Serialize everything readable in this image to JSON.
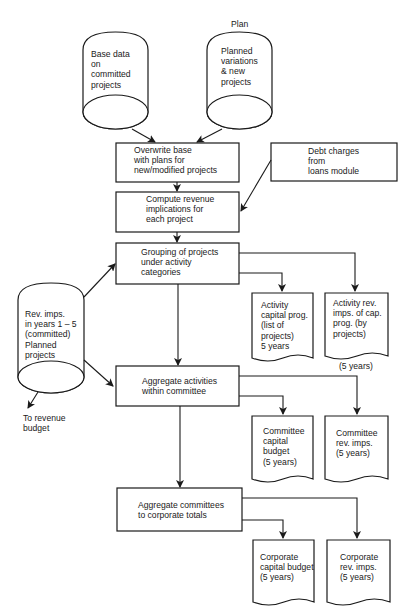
{
  "diagram": {
    "type": "flowchart",
    "colors": {
      "stroke": "#1a1a1a",
      "background": "#ffffff"
    },
    "nodes": {
      "plan_label": "Plan",
      "base_data_store": [
        "Base data",
        "on",
        "committed",
        "projects"
      ],
      "planned_variations_store": [
        "Planned",
        "variations",
        "& new",
        "projects"
      ],
      "overwrite_process": [
        "Overwrite base",
        "with plans for",
        "new/modified projects"
      ],
      "debt_charges_input": [
        "Debt charges",
        "from",
        "loans module"
      ],
      "compute_process": [
        "Compute revenue",
        "implications for",
        "each project"
      ],
      "grouping_process": [
        "Grouping of projects",
        "under activity",
        "categories"
      ],
      "activity_capital_doc": [
        "Activity",
        "capital prog.",
        "(list of",
        "projects)",
        "5 years"
      ],
      "activity_rev_doc": [
        "Activity rev.",
        "imps. of cap.",
        "prog. (by",
        "projects)"
      ],
      "activity_rev_note": "(5 years)",
      "rev_imps_store": [
        "Rev. imps.",
        "in years 1 – 5",
        "(committed)",
        "Planned",
        "projects"
      ],
      "to_revenue_budget": [
        "To revenue",
        "budget"
      ],
      "aggregate_activities_process": [
        "Aggregate activities",
        "within committee"
      ],
      "committee_capital_doc": [
        "Committee",
        "capital",
        "budget",
        "(5 years)"
      ],
      "committee_rev_doc": [
        "Committee",
        "rev. imps.",
        "(5 years)"
      ],
      "aggregate_committees_process": [
        "Aggregate committees",
        "to corporate totals"
      ],
      "corporate_capital_doc": [
        "Corporate",
        "capital budget",
        "(5 years)"
      ],
      "corporate_rev_doc": [
        "Corporate",
        "rev. imps.",
        "(5 years)"
      ]
    },
    "edges": [
      [
        "base_data_store",
        "overwrite_process"
      ],
      [
        "planned_variations_store",
        "overwrite_process"
      ],
      [
        "overwrite_process",
        "compute_process"
      ],
      [
        "debt_charges_input",
        "compute_process"
      ],
      [
        "compute_process",
        "grouping_process"
      ],
      [
        "rev_imps_store",
        "grouping_process"
      ],
      [
        "grouping_process",
        "activity_capital_doc"
      ],
      [
        "grouping_process",
        "activity_rev_doc"
      ],
      [
        "grouping_process",
        "aggregate_activities_process"
      ],
      [
        "rev_imps_store",
        "aggregate_activities_process"
      ],
      [
        "rev_imps_store",
        "to_revenue_budget"
      ],
      [
        "aggregate_activities_process",
        "committee_capital_doc"
      ],
      [
        "aggregate_activities_process",
        "committee_rev_doc"
      ],
      [
        "aggregate_activities_process",
        "aggregate_committees_process"
      ],
      [
        "aggregate_committees_process",
        "corporate_capital_doc"
      ],
      [
        "aggregate_committees_process",
        "corporate_rev_doc"
      ]
    ]
  }
}
